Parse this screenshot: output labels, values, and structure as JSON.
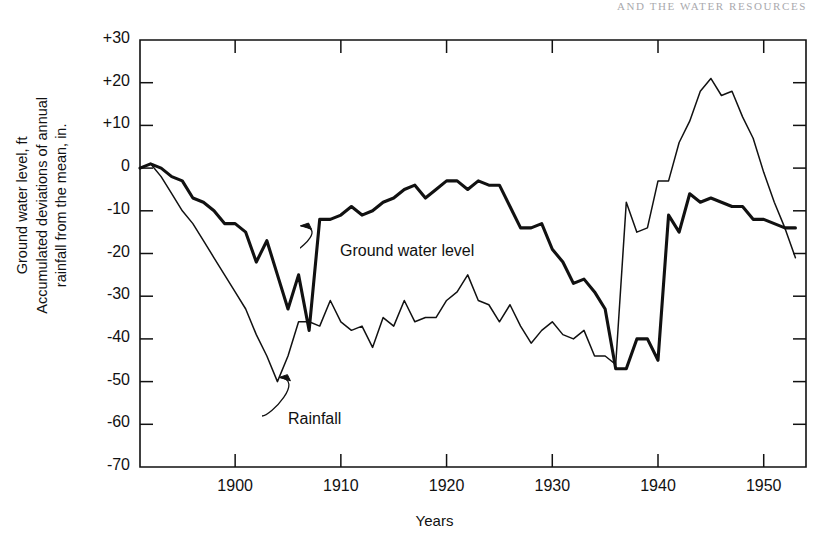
{
  "running_head": "AND THE WATER RESOURCES",
  "axes": {
    "ylabel": "Ground water level, ft\nAccumulated deviations of annual\nrainfall from the mean, in.",
    "xlabel": "Years"
  },
  "annotations": [
    {
      "name": "ground-water-level",
      "text": "Ground water level"
    },
    {
      "name": "rainfall",
      "text": "Rainfall"
    }
  ],
  "colors": {
    "line": "#111111",
    "axis": "#111111",
    "background": "#ffffff",
    "running_head": "#9a9aa0"
  },
  "chart_data": {
    "type": "line",
    "title": "",
    "subtitle": "",
    "xlabel": "Years",
    "ylabel": "Ground water level, ft / Accumulated deviations of annual rainfall from the mean, in.",
    "xlim": [
      1891,
      1954
    ],
    "ylim": [
      -70,
      30
    ],
    "xticks": [
      1900,
      1910,
      1920,
      1930,
      1940,
      1950
    ],
    "yticks": [
      30,
      20,
      10,
      0,
      -10,
      -20,
      -30,
      -40,
      -50,
      -60,
      -70
    ],
    "ytick_labels": [
      "+30",
      "+20",
      "+10",
      "0",
      "-10",
      "-20",
      "-30",
      "-40",
      "-50",
      "-60",
      "-70"
    ],
    "xtick_labels": [
      "1900",
      "1910",
      "1920",
      "1930",
      "1940",
      "1950"
    ],
    "grid": false,
    "legend": "annotations-inline",
    "x": [
      1891,
      1892,
      1893,
      1894,
      1895,
      1896,
      1897,
      1898,
      1899,
      1900,
      1901,
      1902,
      1903,
      1904,
      1905,
      1906,
      1907,
      1908,
      1909,
      1910,
      1911,
      1912,
      1913,
      1914,
      1915,
      1916,
      1917,
      1918,
      1919,
      1920,
      1921,
      1922,
      1923,
      1924,
      1925,
      1926,
      1927,
      1928,
      1929,
      1930,
      1931,
      1932,
      1933,
      1934,
      1935,
      1936,
      1937,
      1938,
      1939,
      1940,
      1941,
      1942,
      1943,
      1944,
      1945,
      1946,
      1947,
      1948,
      1949,
      1950,
      1951,
      1952,
      1953
    ],
    "series": [
      {
        "name": "Ground water level",
        "units": "ft",
        "style": "thick",
        "values": [
          0,
          1,
          0,
          -2,
          -3,
          -7,
          -8,
          -10,
          -13,
          -13,
          -15,
          -22,
          -17,
          -25,
          -33,
          -25,
          -38,
          -12,
          -12,
          -11,
          -9,
          -11,
          -10,
          -8,
          -7,
          -5,
          -4,
          -7,
          -5,
          -3,
          -3,
          -5,
          -3,
          -4,
          -4,
          -9,
          -14,
          -14,
          -13,
          -19,
          -22,
          -27,
          -26,
          -29,
          -33,
          -47,
          -47,
          -40,
          -40,
          -45,
          -11,
          -15,
          -6,
          -8,
          -7,
          -8,
          -9,
          -9,
          -12,
          -12,
          -13,
          -14,
          -14
        ]
      },
      {
        "name": "Rainfall",
        "units": "in.",
        "style": "thin",
        "values": [
          0,
          1,
          -2,
          -6,
          -10,
          -13,
          -17,
          -21,
          -25,
          -29,
          -33,
          -39,
          -44,
          -50,
          -44,
          -36,
          -36,
          -37,
          -31,
          -36,
          -38,
          -37,
          -42,
          -35,
          -37,
          -31,
          -36,
          -35,
          -35,
          -31,
          -29,
          -25,
          -31,
          -32,
          -36,
          -32,
          -37,
          -41,
          -38,
          -36,
          -39,
          -40,
          -38,
          -44,
          -44,
          -46,
          -8,
          -15,
          -14,
          -3,
          -3,
          6,
          11,
          18,
          21,
          17,
          18,
          12,
          7,
          -1,
          -8,
          -14,
          -21
        ]
      }
    ]
  }
}
